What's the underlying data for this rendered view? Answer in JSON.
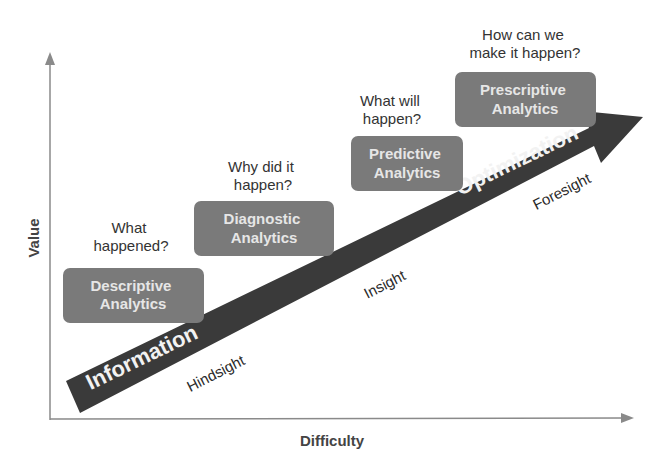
{
  "axes": {
    "x_label": "Difficulty",
    "y_label": "Value"
  },
  "stages": [
    {
      "id": "descriptive",
      "question_lines": [
        "What",
        "happened?"
      ],
      "box_lines": [
        "Descriptive",
        "Analytics"
      ]
    },
    {
      "id": "diagnostic",
      "question_lines": [
        "Why did it",
        "happen?"
      ],
      "box_lines": [
        "Diagnostic",
        "Analytics"
      ]
    },
    {
      "id": "predictive",
      "question_lines": [
        "What will",
        "happen?"
      ],
      "box_lines": [
        "Predictive",
        "Analytics"
      ]
    },
    {
      "id": "prescriptive",
      "question_lines": [
        "How can we",
        "make it happen?"
      ],
      "box_lines": [
        "Prescriptive",
        "Analytics"
      ]
    }
  ],
  "arrow": {
    "start_label": "Information",
    "end_label": "Optimization"
  },
  "sight_labels": [
    "Hindsight",
    "Insight",
    "Foresight"
  ],
  "colors": {
    "box_fill": "#7a7a7a",
    "arrow_fill": "#3a3a3a",
    "axis_color": "#8a8a8a",
    "box_text": "#e6e6e6",
    "question_text": "#333333"
  }
}
